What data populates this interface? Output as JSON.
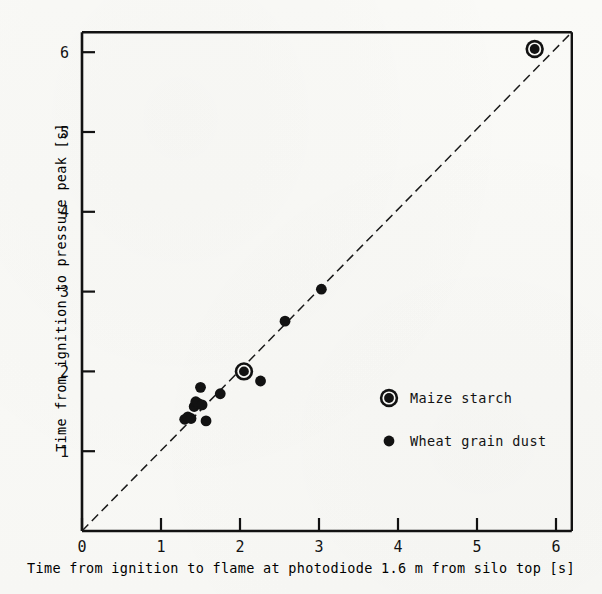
{
  "chart_data": {
    "type": "scatter",
    "title": "",
    "xlabel": "Time from ignition to flame at photodiode 1.6 m from silo top [s]",
    "ylabel": "Time from ignition to pressure peak [s]",
    "xlim": [
      0,
      6.2
    ],
    "ylim": [
      0,
      6.25
    ],
    "xticks": [
      "0",
      "1",
      "2",
      "3",
      "4",
      "5",
      "6"
    ],
    "xtick_values": [
      0,
      1,
      2,
      3,
      4,
      5,
      6
    ],
    "yticks": [
      "1",
      "2",
      "3",
      "4",
      "5",
      "6"
    ],
    "ytick_values": [
      1,
      2,
      3,
      4,
      5,
      6
    ],
    "grid": false,
    "legend_position": "center-right",
    "reference_line": {
      "name": "1:1 diagonal",
      "style": "dashed",
      "from": [
        0,
        0
      ],
      "to": [
        6.2,
        6.25
      ]
    },
    "series": [
      {
        "name": "Maize starch",
        "marker": "circled-dot",
        "color": "#121212",
        "points": [
          [
            2.05,
            2.0
          ],
          [
            5.73,
            6.04
          ]
        ]
      },
      {
        "name": "Wheat grain dust",
        "marker": "filled-dot",
        "color": "#121212",
        "points": [
          [
            1.3,
            1.4
          ],
          [
            1.34,
            1.43
          ],
          [
            1.38,
            1.41
          ],
          [
            1.42,
            1.56
          ],
          [
            1.44,
            1.62
          ],
          [
            1.47,
            1.6
          ],
          [
            1.5,
            1.8
          ],
          [
            1.52,
            1.58
          ],
          [
            1.57,
            1.38
          ],
          [
            1.75,
            1.72
          ],
          [
            2.26,
            1.88
          ],
          [
            2.57,
            2.63
          ],
          [
            3.03,
            3.03
          ]
        ]
      }
    ]
  },
  "legend": {
    "entries": [
      {
        "label": "Maize starch",
        "marker": "circled-dot"
      },
      {
        "label": "Wheat grain dust",
        "marker": "filled-dot"
      }
    ]
  },
  "colors": {
    "ink": "#121212",
    "paper": "#faf9f6"
  }
}
